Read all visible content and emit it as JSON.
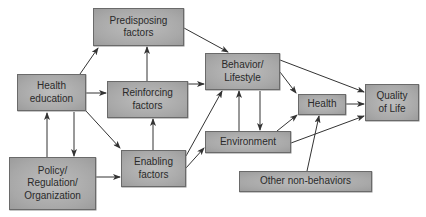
{
  "diagram": {
    "type": "flowchart",
    "nodes": [
      {
        "id": "predisposing",
        "label": "Predisposing\nfactors"
      },
      {
        "id": "health_education",
        "label": "Health\neducation"
      },
      {
        "id": "reinforcing",
        "label": "Reinforcing\nfactors"
      },
      {
        "id": "behavior",
        "label": "Behavior/\nLifestyle"
      },
      {
        "id": "health",
        "label": "Health"
      },
      {
        "id": "quality_of_life",
        "label": "Quality\nof Life"
      },
      {
        "id": "enabling",
        "label": "Enabling\nfactors"
      },
      {
        "id": "policy",
        "label": "Policy/\nRegulation/\nOrganization"
      },
      {
        "id": "environment",
        "label": "Environment"
      },
      {
        "id": "other",
        "label": "Other non-behaviors"
      }
    ],
    "edges": [
      {
        "from": "health_education",
        "to": "predisposing"
      },
      {
        "from": "health_education",
        "to": "reinforcing"
      },
      {
        "from": "health_education",
        "to": "enabling"
      },
      {
        "from": "health_education",
        "to": "policy"
      },
      {
        "from": "policy",
        "to": "health_education"
      },
      {
        "from": "policy",
        "to": "enabling"
      },
      {
        "from": "reinforcing",
        "to": "predisposing"
      },
      {
        "from": "enabling",
        "to": "reinforcing"
      },
      {
        "from": "predisposing",
        "to": "behavior"
      },
      {
        "from": "reinforcing",
        "to": "behavior"
      },
      {
        "from": "enabling",
        "to": "behavior"
      },
      {
        "from": "enabling",
        "to": "environment"
      },
      {
        "from": "behavior",
        "to": "environment"
      },
      {
        "from": "environment",
        "to": "behavior"
      },
      {
        "from": "behavior",
        "to": "health"
      },
      {
        "from": "behavior",
        "to": "quality_of_life"
      },
      {
        "from": "environment",
        "to": "health"
      },
      {
        "from": "environment",
        "to": "quality_of_life"
      },
      {
        "from": "health",
        "to": "quality_of_life"
      },
      {
        "from": "other",
        "to": "health"
      }
    ],
    "colors": {
      "box_fill": "#ababab",
      "box_border": "#6a6a6a",
      "arrow": "#333333",
      "text": "#2a2a2a"
    }
  }
}
